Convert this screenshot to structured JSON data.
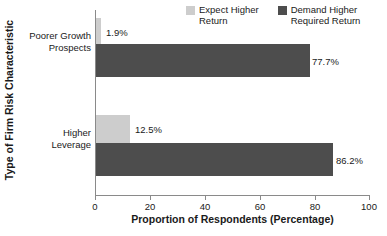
{
  "chart_data": {
    "type": "bar",
    "orientation": "horizontal",
    "title": "",
    "xlabel": "Proportion of Respondents (Percentage)",
    "ylabel": "Type of Firm Risk Characteristic",
    "xlim": [
      0,
      100
    ],
    "xticks": [
      0,
      20,
      40,
      60,
      80,
      100
    ],
    "xtick_labels": [
      "0",
      "20",
      "40",
      "60",
      "80",
      "100"
    ],
    "grid": false,
    "legend_position": "top-right",
    "categories": [
      "Poorer Growth Prospects",
      "Higher Leverage"
    ],
    "category_lines": [
      [
        "Poorer Growth",
        "Prospects"
      ],
      [
        "Higher",
        "Leverage"
      ]
    ],
    "series": [
      {
        "name": "Expect Higher Return",
        "name_lines": [
          "Expect Higher",
          "Return"
        ],
        "color": "#cdcdcd",
        "values": [
          1.9,
          12.5
        ],
        "value_labels": [
          "1.9%",
          "12.5%"
        ]
      },
      {
        "name": "Demand Higher Required Return",
        "name_lines": [
          "Demand Higher",
          "Required Return"
        ],
        "color": "#4d4d4d",
        "values": [
          77.7,
          86.2
        ],
        "value_labels": [
          "77.7%",
          "86.2%"
        ]
      }
    ]
  },
  "axis": {
    "x_title": "Proportion of Respondents (Percentage)",
    "y_title": "Type of Firm Risk Characteristic",
    "ticks": [
      "0",
      "20",
      "40",
      "60",
      "80",
      "100"
    ]
  },
  "categories": {
    "cat0_line1": "Poorer Growth",
    "cat0_line2": "Prospects",
    "cat1_line1": "Higher",
    "cat1_line2": "Leverage"
  },
  "legend": {
    "item0_line1": "Expect Higher",
    "item0_line2": "Return",
    "item1_line1": "Demand Higher",
    "item1_line2": "Required Return"
  },
  "values": {
    "cat0_light": "1.9%",
    "cat0_dark": "77.7%",
    "cat1_light": "12.5%",
    "cat1_dark": "86.2%"
  },
  "colors": {
    "light_series": "#cdcdcd",
    "dark_series": "#4d4d4d",
    "axis": "#8a8a8a",
    "text": "#1a1a1a",
    "background": "#ffffff"
  }
}
